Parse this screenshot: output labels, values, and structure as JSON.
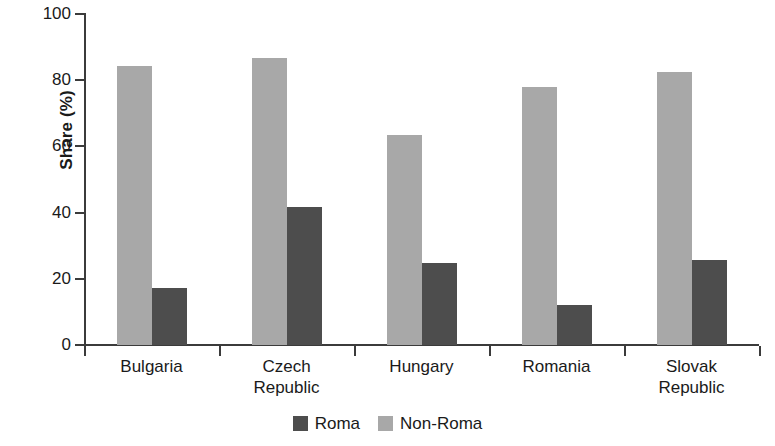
{
  "chart_data": {
    "type": "bar",
    "title": "",
    "xlabel": "",
    "ylabel": "Share (%)",
    "ylim": [
      0,
      100
    ],
    "yticks": [
      0,
      20,
      40,
      60,
      80,
      100
    ],
    "ytick_labels": [
      "0",
      "20",
      "40",
      "60",
      "80",
      "100"
    ],
    "grid": false,
    "legend_position": "bottom-center",
    "categories": [
      "Bulgaria",
      "Czech Republic",
      "Hungary",
      "Romania",
      "Slovak Republic"
    ],
    "category_label_lines": [
      [
        "Bulgaria"
      ],
      [
        "Czech",
        "Republic"
      ],
      [
        "Hungary"
      ],
      [
        "Romania"
      ],
      [
        "Slovak",
        "Republic"
      ]
    ],
    "series": [
      {
        "name": "Non-Roma",
        "color": "#a8a8a8",
        "values": [
          84.3,
          86.7,
          63.4,
          78.0,
          82.5
        ]
      },
      {
        "name": "Roma",
        "color": "#4d4d4d",
        "values": [
          17.2,
          41.7,
          24.8,
          12.1,
          25.7
        ]
      }
    ],
    "legend": [
      {
        "label": "Roma",
        "color": "#4d4d4d"
      },
      {
        "label": "Non-Roma",
        "color": "#a8a8a8"
      }
    ]
  },
  "colors": {
    "roma": "#4d4d4d",
    "nonroma": "#a8a8a8",
    "axis": "#3b3b3b",
    "text": "#1a1a1a",
    "background": "#ffffff"
  }
}
